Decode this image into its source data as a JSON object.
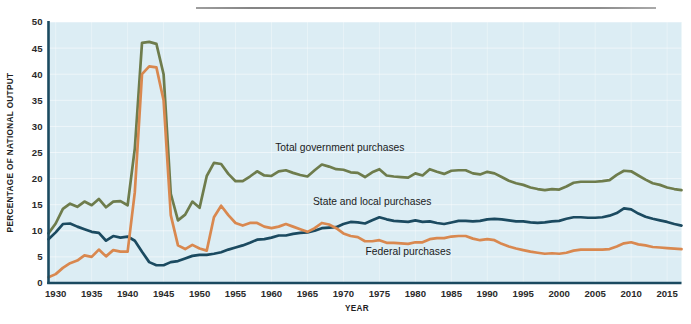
{
  "figure": {
    "background_color": "#ffffff",
    "plot_background_color": "#dcedf4",
    "axis_color": "#1b4a60",
    "rule_present": true
  },
  "chart_data": {
    "type": "line",
    "title": "",
    "subtitle": "",
    "xlabel": "YEAR",
    "ylabel": "PERCENTAGE OF NATIONAL OUTPUT",
    "xlim": [
      1929,
      2017
    ],
    "ylim": [
      0,
      50
    ],
    "yticks": [
      0,
      5,
      10,
      15,
      20,
      25,
      30,
      35,
      40,
      45,
      50
    ],
    "xticks": [
      1930,
      1935,
      1940,
      1945,
      1950,
      1955,
      1960,
      1965,
      1970,
      1975,
      1980,
      1985,
      1990,
      1995,
      2000,
      2005,
      2010,
      2015
    ],
    "grid": true,
    "legend_position": "inline-annotations",
    "x": [
      1929,
      1930,
      1931,
      1932,
      1933,
      1934,
      1935,
      1936,
      1937,
      1938,
      1939,
      1940,
      1941,
      1942,
      1943,
      1944,
      1945,
      1946,
      1947,
      1948,
      1949,
      1950,
      1951,
      1952,
      1953,
      1954,
      1955,
      1956,
      1957,
      1958,
      1959,
      1960,
      1961,
      1962,
      1963,
      1964,
      1965,
      1966,
      1967,
      1968,
      1969,
      1970,
      1971,
      1972,
      1973,
      1974,
      1975,
      1976,
      1977,
      1978,
      1979,
      1980,
      1981,
      1982,
      1983,
      1984,
      1985,
      1986,
      1987,
      1988,
      1989,
      1990,
      1991,
      1992,
      1993,
      1994,
      1995,
      1996,
      1997,
      1998,
      1999,
      2000,
      2001,
      2002,
      2003,
      2004,
      2005,
      2006,
      2007,
      2008,
      2009,
      2010,
      2011,
      2012,
      2013,
      2014,
      2015,
      2016,
      2017
    ],
    "series": [
      {
        "name": "Total government purchases",
        "color": "#6e7c4c",
        "label_x": 1969.5,
        "label_y": 25.3,
        "values": [
          9.5,
          11.4,
          14.2,
          15.2,
          14.6,
          15.6,
          14.9,
          16.1,
          14.5,
          15.6,
          15.7,
          14.9,
          25.8,
          46.0,
          46.2,
          45.8,
          40.0,
          17.1,
          12.0,
          13.1,
          15.6,
          14.4,
          20.5,
          23.0,
          22.8,
          20.9,
          19.5,
          19.5,
          20.4,
          21.4,
          20.6,
          20.5,
          21.4,
          21.6,
          21.1,
          20.7,
          20.4,
          21.6,
          22.7,
          22.3,
          21.8,
          21.7,
          21.2,
          21.1,
          20.3,
          21.2,
          21.8,
          20.6,
          20.4,
          20.3,
          20.2,
          21.0,
          20.6,
          21.8,
          21.3,
          20.9,
          21.5,
          21.6,
          21.6,
          21.0,
          20.8,
          21.3,
          21.0,
          20.3,
          19.6,
          19.1,
          18.8,
          18.3,
          18.0,
          17.8,
          18.0,
          17.9,
          18.5,
          19.2,
          19.4,
          19.4,
          19.4,
          19.5,
          19.7,
          20.7,
          21.5,
          21.4,
          20.6,
          19.8,
          19.1,
          18.8,
          18.3,
          18.0,
          17.8
        ]
      },
      {
        "name": "State and local purchases",
        "color": "#1b4a60",
        "label_x": 1974.0,
        "label_y": 14.9,
        "values": [
          8.4,
          9.7,
          11.3,
          11.4,
          10.8,
          10.3,
          9.8,
          9.6,
          8.1,
          9.0,
          8.7,
          8.9,
          8.1,
          6.0,
          4.0,
          3.4,
          3.4,
          4.0,
          4.2,
          4.7,
          5.2,
          5.4,
          5.4,
          5.6,
          5.9,
          6.4,
          6.8,
          7.2,
          7.7,
          8.3,
          8.4,
          8.7,
          9.1,
          9.1,
          9.4,
          9.6,
          9.7,
          10.0,
          10.5,
          10.6,
          10.7,
          11.3,
          11.7,
          11.6,
          11.4,
          12.0,
          12.6,
          12.2,
          11.9,
          11.8,
          11.7,
          12.0,
          11.7,
          11.8,
          11.5,
          11.3,
          11.6,
          11.9,
          11.9,
          11.8,
          11.9,
          12.2,
          12.3,
          12.2,
          12.0,
          11.8,
          11.8,
          11.6,
          11.5,
          11.6,
          11.8,
          11.9,
          12.3,
          12.6,
          12.6,
          12.5,
          12.5,
          12.6,
          12.9,
          13.4,
          14.3,
          14.1,
          13.3,
          12.7,
          12.3,
          12.0,
          11.7,
          11.3,
          11.0
        ]
      },
      {
        "name": "Federal purchases",
        "color": "#d9884f",
        "label_x": 1979.0,
        "label_y": 5.4,
        "values": [
          1.1,
          1.7,
          2.9,
          3.8,
          4.3,
          5.3,
          5.0,
          6.4,
          5.1,
          6.3,
          6.0,
          6.0,
          17.4,
          40.0,
          41.5,
          41.3,
          35.0,
          13.0,
          7.2,
          6.5,
          7.3,
          6.6,
          6.2,
          12.6,
          14.8,
          13.0,
          11.5,
          11.0,
          11.5,
          11.5,
          10.8,
          10.5,
          10.8,
          11.3,
          10.8,
          10.3,
          9.8,
          10.5,
          11.5,
          11.2,
          10.5,
          9.5,
          9.0,
          8.8,
          8.0,
          8.0,
          8.2,
          7.7,
          7.7,
          7.6,
          7.5,
          7.8,
          7.8,
          8.4,
          8.6,
          8.6,
          8.9,
          9.0,
          9.0,
          8.5,
          8.2,
          8.4,
          8.2,
          7.5,
          7.0,
          6.6,
          6.3,
          6.0,
          5.8,
          5.6,
          5.7,
          5.6,
          5.8,
          6.2,
          6.4,
          6.4,
          6.4,
          6.4,
          6.5,
          7.0,
          7.6,
          7.8,
          7.4,
          7.2,
          6.9,
          6.8,
          6.7,
          6.6,
          6.5
        ]
      }
    ]
  }
}
